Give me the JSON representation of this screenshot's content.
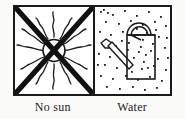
{
  "figure": {
    "background_color": "#fbfbfa",
    "ink_color": "#1a1a1a",
    "frame": {
      "border_color": "#1a1a1a",
      "border_width_px": 2,
      "fill_color": "#ffffff"
    }
  },
  "panels": [
    {
      "id": "no-sun",
      "caption": "No sun",
      "icon_name": "sun-crossed-out-icon",
      "symbol_parts": [
        "sun-disc",
        "wavy-rays",
        "cross-out-x"
      ],
      "ray_count": 12,
      "stroke_color": "#1a1a1a"
    },
    {
      "id": "water",
      "caption": "Water",
      "icon_name": "watering-can-icon",
      "symbol_parts": [
        "can-body",
        "can-handle",
        "can-spout",
        "water-droplets"
      ],
      "droplet_count": 64,
      "stroke_color": "#1a1a1a"
    }
  ],
  "captions": {
    "left": "No sun",
    "right": "Water"
  }
}
